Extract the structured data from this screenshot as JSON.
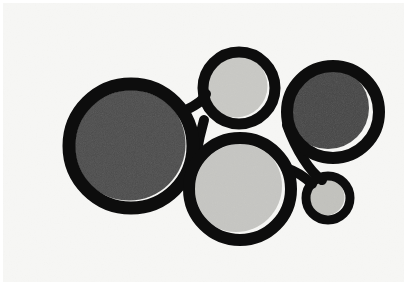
{
  "artwork": {
    "title": "Abstract composition of interlocking outlined circles",
    "medium_look": "flat graphic print on off-white paper",
    "canvas": {
      "width": 407,
      "height": 285
    },
    "palette": {
      "background": "#f7f7f5",
      "paper_edge": "#ffffff",
      "outline": "#0d0d0d",
      "fill_dark_gray": "#4d4d4d",
      "fill_darker_gray": "#474747",
      "fill_light_gray": "#c9c9c5",
      "fill_light_gray_alt": "#c6c6c2",
      "fill_light_small": "#c2c2be"
    },
    "stroke_widths": {
      "large_ring": 13,
      "medium_ring": 11,
      "small_ring": 9,
      "connector": 9
    },
    "shapes": [
      {
        "name": "large-left-circle",
        "label": "Large dark gray circle, left",
        "cx": 131,
        "cy": 146,
        "r": 62,
        "stroke_width": 13,
        "fill": "#4d4d4d",
        "fill_offset_x": -2,
        "fill_offset_y": -2
      },
      {
        "name": "top-middle-circle",
        "label": "Small light gray circle, top middle",
        "cx": 239,
        "cy": 88,
        "r": 36,
        "stroke_width": 11,
        "fill": "#c9c9c5",
        "fill_offset_x": -3,
        "fill_offset_y": -2
      },
      {
        "name": "right-circle",
        "label": "Medium dark gray circle, right",
        "cx": 333,
        "cy": 112,
        "r": 46,
        "stroke_width": 12,
        "fill": "#474747",
        "fill_offset_x": -5,
        "fill_offset_y": -4
      },
      {
        "name": "bottom-middle-circle",
        "label": "Medium light gray circle, bottom middle",
        "cx": 240,
        "cy": 189,
        "r": 51,
        "stroke_width": 12,
        "fill": "#c6c6c2",
        "fill_offset_x": -4,
        "fill_offset_y": -3
      },
      {
        "name": "small-bottom-right-circle",
        "label": "Small light gray circle, bottom right",
        "cx": 328,
        "cy": 198,
        "r": 22,
        "stroke_width": 9,
        "fill": "#c2c2be",
        "fill_offset_x": -2,
        "fill_offset_y": -1
      }
    ],
    "connectors": [
      {
        "name": "connector-left-to-top",
        "label": "Arc linking large left circle to top middle circle",
        "path": "M 186 110 C 198 104 204 100 206 94",
        "stroke_width": 10
      },
      {
        "name": "connector-top-to-bottom",
        "label": "Vertical stroke linking top middle circle to bottom middle circle",
        "path": "M 204 120 C 200 134 198 144 196 156",
        "stroke_width": 10
      },
      {
        "name": "connector-right-to-small",
        "label": "Diagonal stroke from right circle down to small circle",
        "path": "M 287 125 C 296 150 310 172 322 180",
        "stroke_width": 10
      },
      {
        "name": "connector-bottom-to-small",
        "label": "Stroke from bottom middle circle to small bottom right circle",
        "path": "M 286 168 C 298 172 306 178 312 184",
        "stroke_width": 10
      }
    ]
  }
}
